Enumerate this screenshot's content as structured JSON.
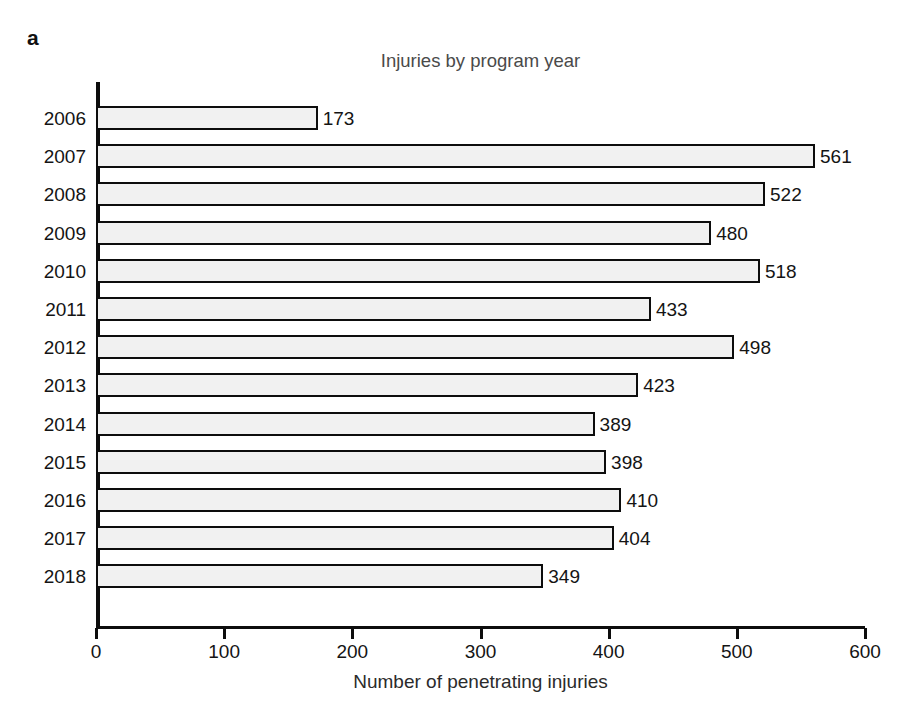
{
  "figure": {
    "panel_label": "a"
  },
  "chart_data": {
    "type": "bar",
    "orientation": "horizontal",
    "title": "Injuries by program year",
    "xlabel": "Number of penetrating injuries",
    "ylabel": "",
    "categories": [
      "2006",
      "2007",
      "2008",
      "2009",
      "2010",
      "2011",
      "2012",
      "2013",
      "2014",
      "2015",
      "2016",
      "2017",
      "2018"
    ],
    "values": [
      173,
      561,
      522,
      480,
      518,
      433,
      498,
      423,
      389,
      398,
      410,
      404,
      349
    ],
    "data_labels": [
      "173",
      "561",
      "522",
      "480",
      "518",
      "433",
      "498",
      "423",
      "389",
      "398",
      "410",
      "404",
      "349"
    ],
    "xlim": [
      0,
      600
    ],
    "xticks": [
      0,
      100,
      200,
      300,
      400,
      500,
      600
    ],
    "xtick_labels": [
      "0",
      "100",
      "200",
      "300",
      "400",
      "500",
      "600"
    ],
    "grid": false,
    "legend": null,
    "bar_fill_color": "#f1f1f1",
    "bar_edge_color": "#0d0d0d",
    "axis_color": "#0d0d0d",
    "text_color": "#141414",
    "title_color": "#4a4a4a",
    "background_color": "#ffffff"
  }
}
